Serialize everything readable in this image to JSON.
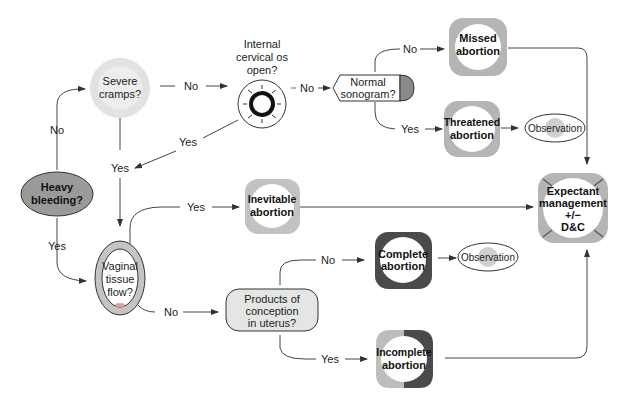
{
  "diagram": {
    "title": "",
    "nodes": {
      "heavy_bleeding": {
        "line1": "Heavy",
        "line2": "bleeding?"
      },
      "severe_cramps": {
        "line1": "Severe",
        "line2": "cramps?"
      },
      "internal_os": {
        "line1": "Internal",
        "line2": "cervical os",
        "line3": "open?"
      },
      "normal_sonogram": {
        "line1": "Normal",
        "line2": "sonogram?"
      },
      "missed_abortion": {
        "line1": "Missed",
        "line2": "abortion"
      },
      "threatened_abortion": {
        "line1": "Threatened",
        "line2": "abortion"
      },
      "observation_1": {
        "label": "Observation"
      },
      "vaginal_tissue": {
        "line1": "Vaginal",
        "line2": "tissue",
        "line3": "flow?"
      },
      "inevitable_abortion": {
        "line1": "Inevitable",
        "line2": "abortion"
      },
      "products_conception": {
        "line1": "Products of",
        "line2": "conception",
        "line3": "in uterus?"
      },
      "complete_abortion": {
        "line1": "Complete",
        "line2": "abortion"
      },
      "observation_2": {
        "label": "Observation"
      },
      "incomplete_abortion": {
        "line1": "Incomplete",
        "line2": "abortion"
      },
      "expectant_management": {
        "line1": "Expectant",
        "line2": "management",
        "line3": "+/−",
        "line4": "D&C"
      }
    },
    "edges": {
      "bleeding_no": "No",
      "bleeding_yes": "Yes",
      "cramps_no": "No",
      "cramps_yes": "Yes",
      "os_yes": "Yes",
      "os_no": "No",
      "sono_no": "No",
      "sono_yes": "Yes",
      "tissue_yes": "Yes",
      "tissue_no": "No",
      "poc_no": "No",
      "poc_yes": "Yes"
    },
    "colors": {
      "light_gray": "#c8c8c8",
      "mid_gray": "#9a9a9a",
      "dark_gray": "#4a4a4a",
      "line": "#333333",
      "poc_fill": "#e4e6e4"
    }
  }
}
